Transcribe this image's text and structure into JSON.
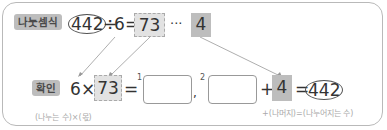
{
  "division": {
    "label": "나눗셈식",
    "dividend": "442",
    "operator": "÷",
    "divisor": "6",
    "equals": "=",
    "quotient": "73",
    "remainder_sep": "···",
    "remainder": "4"
  },
  "check": {
    "label": "확인",
    "divisor": "6",
    "times": "×",
    "quotient": "73",
    "equals": "=",
    "blank1_index": "1",
    "comma": ",",
    "blank2_index": "2",
    "plus": "+",
    "remainder": "4",
    "equals2": "=",
    "result": "442",
    "hint_left": "(나누는 수)×(몫)",
    "hint_right": "+(나머지)=(나누어지는 수)"
  },
  "colors": {
    "badge_bg": "#bdbdbd",
    "highlight": "#e2e2e2",
    "line": "#999999"
  }
}
